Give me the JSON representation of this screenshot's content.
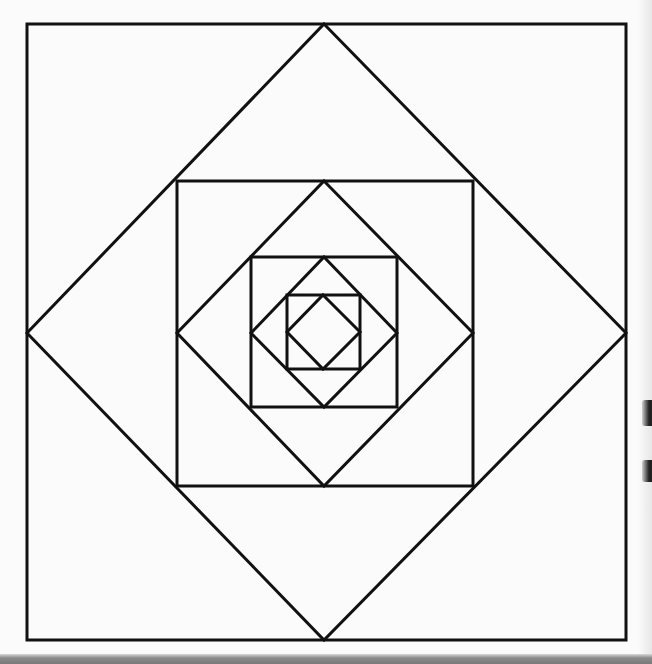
{
  "diagram": {
    "title": "",
    "stroke_color": "#111111",
    "background_color": "#fbfbfb",
    "stroke_width": 3,
    "shapes": [
      {
        "name": "outer-square",
        "type": "square",
        "x1": 27,
        "y1": 24,
        "x2": 626,
        "y2": 640
      },
      {
        "name": "outer-diamond",
        "type": "diamond",
        "points": [
          [
            324,
            24
          ],
          [
            626,
            333
          ],
          [
            324,
            640
          ],
          [
            27,
            333
          ]
        ]
      },
      {
        "name": "second-square",
        "type": "square",
        "x1": 177,
        "y1": 181,
        "x2": 473,
        "y2": 486
      },
      {
        "name": "second-diamond",
        "type": "diamond",
        "points": [
          [
            324,
            181
          ],
          [
            473,
            333
          ],
          [
            324,
            486
          ],
          [
            177,
            333
          ]
        ]
      },
      {
        "name": "third-square",
        "type": "square",
        "x1": 251,
        "y1": 257,
        "x2": 397,
        "y2": 407
      },
      {
        "name": "third-diamond",
        "type": "diamond",
        "points": [
          [
            324,
            257
          ],
          [
            397,
            333
          ],
          [
            324,
            407
          ],
          [
            251,
            333
          ]
        ]
      },
      {
        "name": "inner-square",
        "type": "square",
        "x1": 287,
        "y1": 295,
        "x2": 360,
        "y2": 369
      },
      {
        "name": "inner-diamond",
        "type": "diamond",
        "points": [
          [
            323,
            295
          ],
          [
            360,
            332
          ],
          [
            323,
            369
          ],
          [
            287,
            332
          ]
        ]
      }
    ]
  }
}
